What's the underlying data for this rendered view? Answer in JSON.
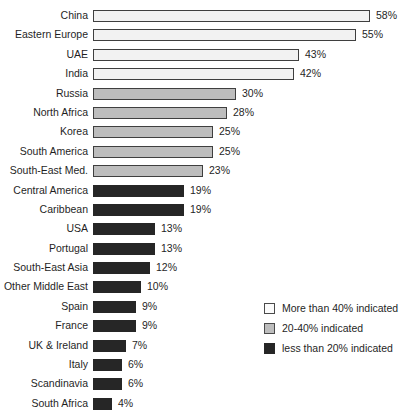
{
  "chart_data": {
    "type": "bar",
    "orientation": "horizontal",
    "title": "",
    "xlabel": "",
    "ylabel": "",
    "xlim": [
      0,
      60
    ],
    "grid": false,
    "categories": [
      "China",
      "Eastern Europe",
      "UAE",
      "India",
      "Russia",
      "North Africa",
      "Korea",
      "South America",
      "South-East Med.",
      "Central America",
      "Caribbean",
      "USA",
      "Portugal",
      "South-East Asia",
      "Other Middle East",
      "Spain",
      "France",
      "UK & Ireland",
      "Italy",
      "Scandinavia",
      "South Africa"
    ],
    "values": [
      58,
      55,
      43,
      42,
      30,
      28,
      25,
      25,
      23,
      19,
      19,
      13,
      13,
      12,
      10,
      9,
      9,
      7,
      6,
      6,
      4
    ],
    "value_labels": [
      "58%",
      "55%",
      "43%",
      "42%",
      "30%",
      "28%",
      "25%",
      "25%",
      "23%",
      "19%",
      "19%",
      "13%",
      "13%",
      "12%",
      "10%",
      "9%",
      "9%",
      "7%",
      "6%",
      "6%",
      "4%"
    ],
    "groups": [
      "high",
      "high",
      "high",
      "high",
      "mid",
      "mid",
      "mid",
      "mid",
      "mid",
      "low",
      "low",
      "low",
      "low",
      "low",
      "low",
      "low",
      "low",
      "low",
      "low",
      "low",
      "low"
    ],
    "legend": {
      "position": "bottom-right",
      "entries": [
        {
          "key": "high",
          "label": "More than 40% indicated",
          "color": "#fbfbfb"
        },
        {
          "key": "mid",
          "label": "20-40% indicated",
          "color": "#bdbdbd"
        },
        {
          "key": "low",
          "label": "less than 20% indicated",
          "color": "#262626"
        }
      ]
    }
  },
  "colors": {
    "bar_high": "#f2f2f2",
    "bar_mid": "#bdbdbd",
    "bar_low": "#262626",
    "bar_outline": "#3f3f3f",
    "text": "#1f1f1f",
    "background": "#ffffff"
  },
  "title_remnant": ""
}
